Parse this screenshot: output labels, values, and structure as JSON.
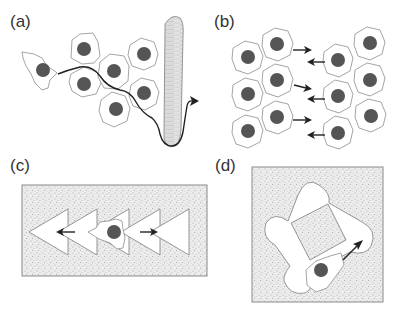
{
  "figure": {
    "panels": [
      {
        "id": "a",
        "label": "(a)",
        "description": "Single cell migrating through a group of epithelial cells toward and into a blood vessel"
      },
      {
        "id": "b",
        "label": "(b)",
        "description": "Two opposing sheets of cells migrating toward each other (collective migration / wound closure)"
      },
      {
        "id": "c",
        "label": "(c)",
        "description": "Cell on a pattern of repeated triangles on textured substrate, with bidirectional arrows"
      },
      {
        "id": "d",
        "label": "(d)",
        "description": "Cell migrating along a square track with rounded corners on textured substrate"
      }
    ],
    "colors": {
      "cell_outline": "#9a9a9a",
      "nucleus": "#555555",
      "arrow": "#222222",
      "substrate": "#e6e6e6",
      "vessel": "#dcdcdc"
    }
  }
}
